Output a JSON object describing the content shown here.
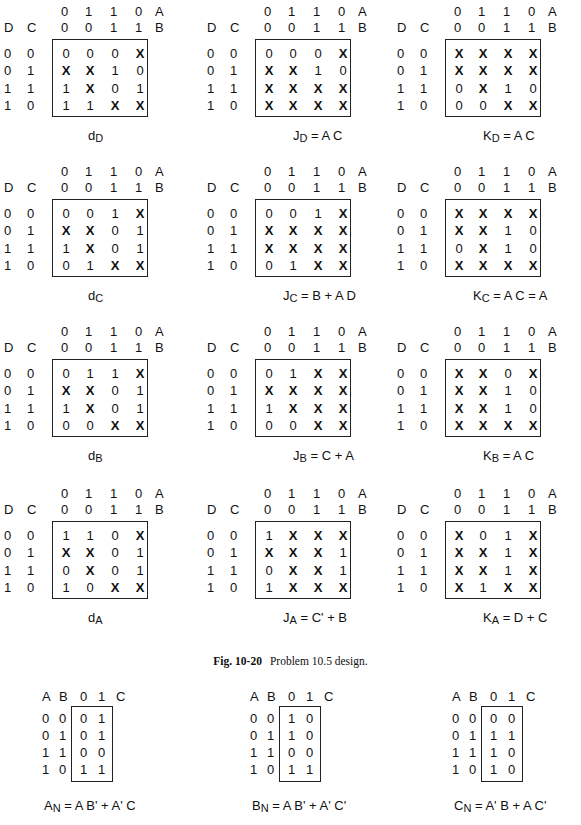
{
  "kmap_axes": {
    "col_A": [
      "0",
      "1",
      "1",
      "0"
    ],
    "col_B": [
      "0",
      "0",
      "1",
      "1"
    ],
    "label_A": "A",
    "label_B": "B",
    "label_D": "D",
    "label_C": "C",
    "row_DC": [
      [
        "0",
        "0"
      ],
      [
        "0",
        "1"
      ],
      [
        "1",
        "1"
      ],
      [
        "1",
        "0"
      ]
    ]
  },
  "maps": [
    {
      "id": "dD",
      "cap_main": "d",
      "cap_sub": "D",
      "cap_rest": "",
      "cells": [
        [
          "0",
          "0",
          "0",
          "X"
        ],
        [
          "X",
          "X",
          "1",
          "0"
        ],
        [
          "1",
          "X",
          "0",
          "1"
        ],
        [
          "1",
          "1",
          "X",
          "X"
        ]
      ]
    },
    {
      "id": "JD",
      "cap_main": "J",
      "cap_sub": "D",
      "cap_rest": " = A C",
      "cells": [
        [
          "0",
          "0",
          "0",
          "X"
        ],
        [
          "X",
          "X",
          "1",
          "0"
        ],
        [
          "X",
          "X",
          "X",
          "X"
        ],
        [
          "X",
          "X",
          "X",
          "X"
        ]
      ]
    },
    {
      "id": "KD",
      "cap_main": "K",
      "cap_sub": "D",
      "cap_rest": " = A C",
      "cells": [
        [
          "X",
          "X",
          "X",
          "X"
        ],
        [
          "X",
          "X",
          "X",
          "X"
        ],
        [
          "0",
          "X",
          "1",
          "0"
        ],
        [
          "0",
          "0",
          "X",
          "X"
        ]
      ]
    },
    {
      "id": "dC",
      "cap_main": "d",
      "cap_sub": "C",
      "cap_rest": "",
      "cells": [
        [
          "0",
          "0",
          "1",
          "X"
        ],
        [
          "X",
          "X",
          "0",
          "1"
        ],
        [
          "1",
          "X",
          "0",
          "1"
        ],
        [
          "0",
          "1",
          "X",
          "X"
        ]
      ]
    },
    {
      "id": "JC",
      "cap_main": "J",
      "cap_sub": "C",
      "cap_rest": " = B + A D",
      "cells": [
        [
          "0",
          "0",
          "1",
          "X"
        ],
        [
          "X",
          "X",
          "X",
          "X"
        ],
        [
          "X",
          "X",
          "X",
          "X"
        ],
        [
          "0",
          "1",
          "X",
          "X"
        ]
      ]
    },
    {
      "id": "KC",
      "cap_main": "K",
      "cap_sub": "C",
      "cap_rest": " = A C = A",
      "cells": [
        [
          "X",
          "X",
          "X",
          "X"
        ],
        [
          "X",
          "X",
          "1",
          "0"
        ],
        [
          "0",
          "X",
          "1",
          "0"
        ],
        [
          "X",
          "X",
          "X",
          "X"
        ]
      ]
    },
    {
      "id": "dB",
      "cap_main": "d",
      "cap_sub": "B",
      "cap_rest": "",
      "cells": [
        [
          "0",
          "1",
          "1",
          "X"
        ],
        [
          "X",
          "X",
          "0",
          "1"
        ],
        [
          "1",
          "X",
          "0",
          "1"
        ],
        [
          "0",
          "0",
          "X",
          "X"
        ]
      ]
    },
    {
      "id": "JB",
      "cap_main": "J",
      "cap_sub": "B",
      "cap_rest": " = C + A",
      "cells": [
        [
          "0",
          "1",
          "X",
          "X"
        ],
        [
          "X",
          "X",
          "X",
          "X"
        ],
        [
          "1",
          "X",
          "X",
          "X"
        ],
        [
          "0",
          "0",
          "X",
          "X"
        ]
      ]
    },
    {
      "id": "KB",
      "cap_main": "K",
      "cap_sub": "B",
      "cap_rest": " = A C",
      "cells": [
        [
          "X",
          "X",
          "0",
          "X"
        ],
        [
          "X",
          "X",
          "1",
          "0"
        ],
        [
          "X",
          "X",
          "1",
          "0"
        ],
        [
          "X",
          "X",
          "X",
          "X"
        ]
      ]
    },
    {
      "id": "dA",
      "cap_main": "d",
      "cap_sub": "A",
      "cap_rest": "",
      "cells": [
        [
          "1",
          "1",
          "0",
          "X"
        ],
        [
          "X",
          "X",
          "0",
          "1"
        ],
        [
          "0",
          "X",
          "0",
          "1"
        ],
        [
          "1",
          "0",
          "X",
          "X"
        ]
      ]
    },
    {
      "id": "JA",
      "cap_main": "J",
      "cap_sub": "A",
      "cap_rest": " = C' + B",
      "cells": [
        [
          "1",
          "X",
          "X",
          "X"
        ],
        [
          "X",
          "X",
          "X",
          "1"
        ],
        [
          "0",
          "X",
          "X",
          "1"
        ],
        [
          "1",
          "X",
          "X",
          "X"
        ]
      ]
    },
    {
      "id": "KA",
      "cap_main": "K",
      "cap_sub": "A",
      "cap_rest": " = D + C",
      "cells": [
        [
          "X",
          "0",
          "1",
          "X"
        ],
        [
          "X",
          "X",
          "1",
          "X"
        ],
        [
          "X",
          "X",
          "1",
          "X"
        ],
        [
          "X",
          "1",
          "X",
          "X"
        ]
      ]
    }
  ],
  "figure_caption": {
    "label": "Fig. 10-20",
    "text": "Problem 10.5 design."
  },
  "small_axes": {
    "header": [
      "A",
      "B",
      "0",
      "1",
      "C"
    ],
    "rows_AB": [
      [
        "0",
        "0"
      ],
      [
        "0",
        "1"
      ],
      [
        "1",
        "1"
      ],
      [
        "1",
        "0"
      ]
    ]
  },
  "small_maps": [
    {
      "id": "AN",
      "cap_main": "A",
      "cap_sub": "N",
      "cap_rest": " = A B' + A' C",
      "cells": [
        [
          "0",
          "1"
        ],
        [
          "0",
          "1"
        ],
        [
          "0",
          "0"
        ],
        [
          "1",
          "1"
        ]
      ]
    },
    {
      "id": "BN",
      "cap_main": "B",
      "cap_sub": "N",
      "cap_rest": " = A B' + A' C'",
      "cells": [
        [
          "1",
          "0"
        ],
        [
          "1",
          "0"
        ],
        [
          "0",
          "0"
        ],
        [
          "1",
          "1"
        ]
      ]
    },
    {
      "id": "CN",
      "cap_main": "C",
      "cap_sub": "N",
      "cap_rest": " = A' B + A C'",
      "cells": [
        [
          "0",
          "0"
        ],
        [
          "1",
          "1"
        ],
        [
          "1",
          "0"
        ],
        [
          "1",
          "0"
        ]
      ]
    }
  ]
}
